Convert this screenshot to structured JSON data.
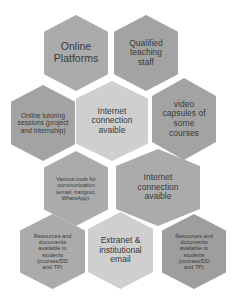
{
  "diagram": {
    "type": "hexagon-cluster",
    "colors": {
      "dark": "#9e9e9e",
      "medium": "#ababab",
      "light": "#cfcfcf",
      "text": "#3a3a3a",
      "background": "#ffffff"
    },
    "hexagons": [
      {
        "id": 1,
        "label": "Online Platforms",
        "shade": "medium"
      },
      {
        "id": 2,
        "label": "Qualified teaching staff",
        "shade": "dark"
      },
      {
        "id": 3,
        "label": "Online tutoring sessions (project and internship)",
        "shade": "dark"
      },
      {
        "id": 4,
        "label": "Internet connection avaible",
        "shade": "light"
      },
      {
        "id": 5,
        "label": "video capsules of some courses",
        "shade": "dark"
      },
      {
        "id": 6,
        "label": "Various tools for communication (email, hangout, WhatsApp).",
        "shade": "medium"
      },
      {
        "id": 7,
        "label": "Internet connection avaible",
        "shade": "medium"
      },
      {
        "id": 8,
        "label": "Resources and documents available to students (courses/DD and TP)",
        "shade": "medium"
      },
      {
        "id": 9,
        "label": "Extranet & institutional email",
        "shade": "light"
      },
      {
        "id": 10,
        "label": "Resources and documents available to students (courses/DD and TP)",
        "shade": "dark"
      }
    ]
  }
}
